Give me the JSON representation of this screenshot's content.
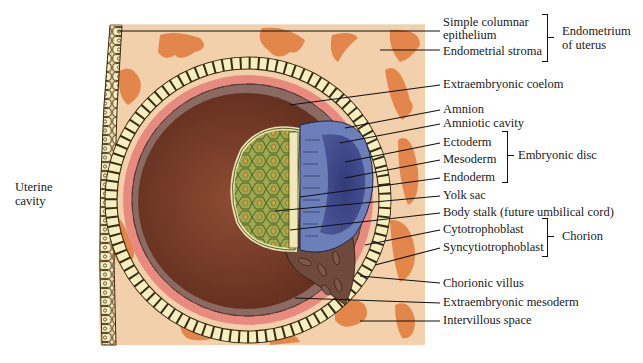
{
  "figure": {
    "colors": {
      "stroma": "#f3d1ac",
      "glands": "#e07a3a",
      "epithelium_cells": "#f4eec0",
      "pink_layer": "#e98a80",
      "mesoderm_cells": "#8a6a62",
      "coelom": "#7a3f2b",
      "yolk_sac": "#9aaa4e",
      "amnion": "#6c7fb8",
      "amniotic_cavity": "#3f4a8c",
      "leader_line": "#111111"
    }
  },
  "labels": {
    "uterine_cavity": [
      "Uterine",
      "cavity"
    ],
    "simple_columnar_epithelium": [
      "Simple columnar",
      "epithelium"
    ],
    "endometrial_stroma": "Endometrial stroma",
    "extraembryonic_coelom": "Extraembryonic coelom",
    "amnion": "Amnion",
    "amniotic_cavity": "Amniotic cavity",
    "ectoderm": "Ectoderm",
    "mesoderm": "Mesoderm",
    "endoderm": "Endoderm",
    "yolk_sac": "Yolk sac",
    "body_stalk": "Body stalk (future umbilical cord)",
    "cytotrophoblast": "Cytotrophoblast",
    "syncytiotrophoblast": "Syncytiotrophoblast",
    "chorionic_villus": "Chorionic villus",
    "extraembryonic_mesoderm": "Extraembryonic mesoderm",
    "intervillous_space": "Intervillous space"
  },
  "groups": {
    "endometrium": [
      "Endometrium",
      "of uterus"
    ],
    "embryonic_disc": "Embryonic disc",
    "chorion": "Chorion"
  }
}
